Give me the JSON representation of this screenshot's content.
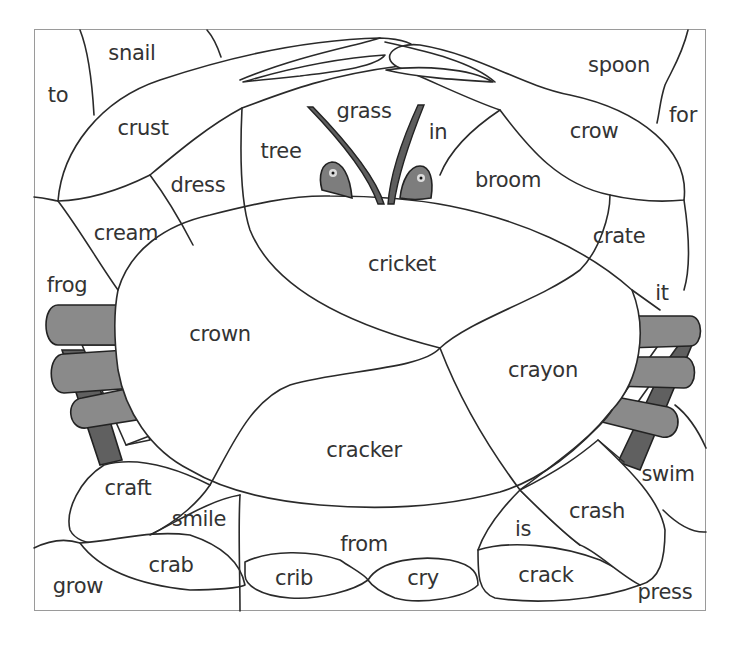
{
  "worksheet": {
    "type": "color-by-word puzzle",
    "subject": "crab",
    "colors": {
      "outline": "#2a2a2a",
      "frame": "#9a9a9a",
      "leg_light": "#8a8a8a",
      "leg_dark": "#606060",
      "eye": "#7d7d7d",
      "text": "#333333"
    },
    "words": [
      {
        "id": "snail",
        "text": "snail",
        "x": 132,
        "y": 53
      },
      {
        "id": "to",
        "text": "to",
        "x": 58,
        "y": 95
      },
      {
        "id": "crust",
        "text": "crust",
        "x": 143,
        "y": 128
      },
      {
        "id": "grass",
        "text": "grass",
        "x": 364,
        "y": 111
      },
      {
        "id": "tree",
        "text": "tree",
        "x": 281,
        "y": 151
      },
      {
        "id": "in",
        "text": "in",
        "x": 438,
        "y": 132
      },
      {
        "id": "spoon",
        "text": "spoon",
        "x": 619,
        "y": 65
      },
      {
        "id": "for",
        "text": "for",
        "x": 683,
        "y": 115
      },
      {
        "id": "crow",
        "text": "crow",
        "x": 594,
        "y": 131
      },
      {
        "id": "dress",
        "text": "dress",
        "x": 198,
        "y": 185
      },
      {
        "id": "broom",
        "text": "broom",
        "x": 508,
        "y": 180
      },
      {
        "id": "cream",
        "text": "cream",
        "x": 126,
        "y": 233
      },
      {
        "id": "crate",
        "text": "crate",
        "x": 619,
        "y": 236
      },
      {
        "id": "cricket",
        "text": "cricket",
        "x": 402,
        "y": 264
      },
      {
        "id": "frog",
        "text": "frog",
        "x": 67,
        "y": 285
      },
      {
        "id": "it",
        "text": "it",
        "x": 662,
        "y": 293
      },
      {
        "id": "crown",
        "text": "crown",
        "x": 220,
        "y": 334
      },
      {
        "id": "crayon",
        "text": "crayon",
        "x": 543,
        "y": 370
      },
      {
        "id": "cracker",
        "text": "cracker",
        "x": 364,
        "y": 450
      },
      {
        "id": "swim",
        "text": "swim",
        "x": 668,
        "y": 474
      },
      {
        "id": "craft",
        "text": "craft",
        "x": 128,
        "y": 488
      },
      {
        "id": "crash",
        "text": "crash",
        "x": 597,
        "y": 511
      },
      {
        "id": "smile",
        "text": "smile",
        "x": 199,
        "y": 519
      },
      {
        "id": "is",
        "text": "is",
        "x": 523,
        "y": 529
      },
      {
        "id": "from",
        "text": "from",
        "x": 364,
        "y": 544
      },
      {
        "id": "crab",
        "text": "crab",
        "x": 171,
        "y": 565
      },
      {
        "id": "crib",
        "text": "crib",
        "x": 294,
        "y": 578
      },
      {
        "id": "cry",
        "text": "cry",
        "x": 423,
        "y": 578
      },
      {
        "id": "crack",
        "text": "crack",
        "x": 546,
        "y": 575
      },
      {
        "id": "grow",
        "text": "grow",
        "x": 78,
        "y": 586
      },
      {
        "id": "press",
        "text": "press",
        "x": 665,
        "y": 592
      }
    ]
  }
}
